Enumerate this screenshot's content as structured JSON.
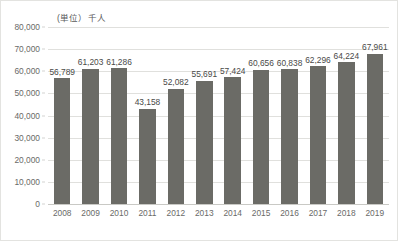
{
  "chart_data": {
    "type": "bar",
    "title": "",
    "subtitle": "",
    "unit_label": "(単位）千人",
    "xlabel": "",
    "ylabel": "",
    "categories": [
      "2008",
      "2009",
      "2010",
      "2011",
      "2012",
      "2013",
      "2014",
      "2015",
      "2016",
      "2017",
      "2018",
      "2019"
    ],
    "values": [
      56789,
      61203,
      61286,
      43158,
      52082,
      55691,
      57424,
      60656,
      60838,
      62296,
      64224,
      67961
    ],
    "value_labels": [
      "56,789",
      "61,203",
      "61,286",
      "43,158",
      "52,082",
      "55,691",
      "57,424",
      "60,656",
      "60,838",
      "62,296",
      "64,224",
      "67,961"
    ],
    "ylim": [
      0,
      80000
    ],
    "ytick_step": 10000,
    "ytick_labels": [
      "80,000",
      "70,000",
      "60,000",
      "50,000",
      "40,000",
      "30,000",
      "20,000",
      "10,000",
      "0"
    ],
    "ytick_values": [
      80000,
      70000,
      60000,
      50000,
      40000,
      30000,
      20000,
      10000,
      0
    ],
    "grid": true,
    "legend": false,
    "legend_position": "none",
    "bar_color": "#6b6b66",
    "grid_color": "#e0e0dd",
    "axis_text_color": "#6a6a68",
    "data_label_color": "#4a4a48",
    "data_labels_shown": true
  }
}
